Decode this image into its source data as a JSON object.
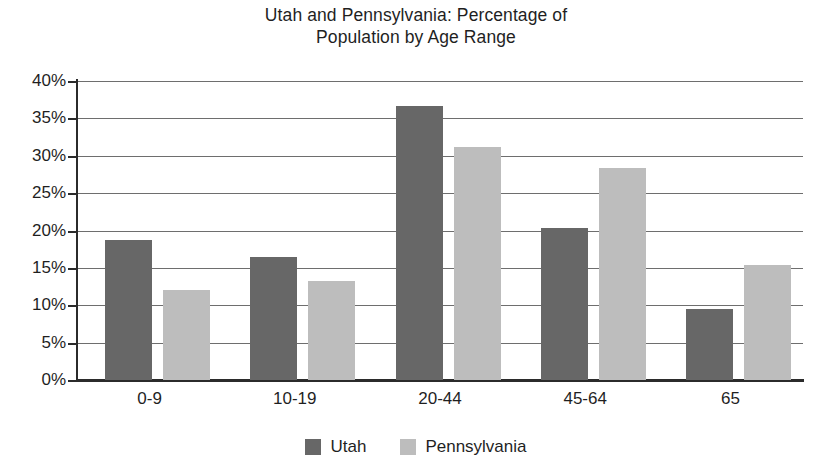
{
  "chart_data": {
    "type": "bar",
    "title": "Utah and Pennsylvania: Percentage of\nPopulation by Age Range",
    "xlabel": "",
    "ylabel": "",
    "categories": [
      "0-9",
      "10-19",
      "20-44",
      "45-64",
      "65"
    ],
    "series": [
      {
        "name": "Utah",
        "color": "#676767",
        "values": [
          18.7,
          16.5,
          36.7,
          20.4,
          9.5
        ]
      },
      {
        "name": "Pennsylvania",
        "color": "#bdbdbd",
        "values": [
          12.1,
          13.2,
          31.2,
          28.4,
          15.4
        ]
      }
    ],
    "ylim": [
      0,
      40
    ],
    "yticks": [
      0,
      5,
      10,
      15,
      20,
      25,
      30,
      35,
      40
    ],
    "ytick_labels": [
      "0%",
      "5%",
      "10%",
      "15%",
      "20%",
      "25%",
      "30%",
      "35%",
      "40%"
    ],
    "grid": true,
    "legend_position": "bottom",
    "value_suffix": "%"
  },
  "legend": {
    "items": [
      {
        "label": "Utah",
        "swatch": "utah"
      },
      {
        "label": "Pennsylvania",
        "swatch": "penn"
      }
    ]
  }
}
